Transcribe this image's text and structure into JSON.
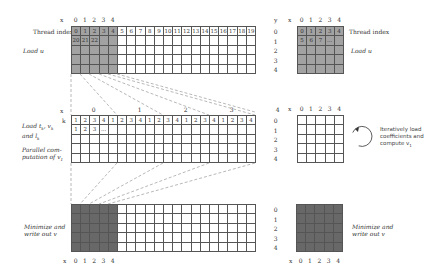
{
  "top": {
    "x_axis_label": "x",
    "x_ticks": [
      "0",
      "1",
      "2",
      "3",
      "4"
    ],
    "row_label": "Thread index",
    "thread_row": [
      "0",
      "1",
      "2",
      "3",
      "4",
      "5",
      "6",
      "7",
      "8",
      "9",
      "10",
      "11",
      "12",
      "13",
      "14",
      "15",
      "16",
      "17",
      "18",
      "19"
    ],
    "second_row": [
      "20",
      "21",
      "22",
      "",
      "",
      "",
      "",
      "",
      "",
      "",
      "",
      "",
      "",
      "",
      "",
      "",
      "",
      "",
      "",
      ""
    ],
    "step_label": "Load u"
  },
  "top_right": {
    "y_axis_label": "y",
    "x_axis_label": "x",
    "y_ticks": [
      "0",
      "1",
      "2",
      "3",
      "4"
    ],
    "x_ticks": [
      "0",
      "1",
      "2",
      "3",
      "4"
    ],
    "thread_row": [
      "0",
      "1",
      "2",
      "3",
      "4"
    ],
    "second_row": [
      "5",
      "6",
      "7",
      "...",
      ""
    ],
    "row_label": "Thread index",
    "step_label": "Load u"
  },
  "middle": {
    "x_axis_label": "x",
    "k_label": "k",
    "group_ticks": [
      "0",
      "1",
      "2",
      "3",
      "4"
    ],
    "k_row": [
      "1",
      "2",
      "3",
      "4",
      "1",
      "2",
      "3",
      "4",
      "1",
      "2",
      "3",
      "4",
      "1",
      "2",
      "3",
      "4",
      "1",
      "2",
      "3",
      "4"
    ],
    "second_row": [
      "1",
      "2",
      "3",
      "...",
      "",
      "",
      "",
      "",
      "",
      "",
      "",
      "",
      "",
      "",
      "",
      "",
      "",
      "",
      "",
      ""
    ],
    "step_label_1": "Load t",
    "step_label_1_line2": "and l",
    "step_label_2": "Parallel com-",
    "step_label_2_line2": "putation of v"
  },
  "middle_right": {
    "x_axis_label": "x",
    "y_ticks": [
      "0",
      "1",
      "2",
      "3",
      "4"
    ],
    "x_ticks": [
      "0",
      "1",
      "2",
      "3",
      "4"
    ],
    "loop_text": [
      "Iteratively load",
      "coefficients and",
      "compute v"
    ]
  },
  "bottom": {
    "x_axis_label": "x",
    "x_ticks": [
      "0",
      "1",
      "2",
      "3",
      "4"
    ],
    "step_label": [
      "Minimize and",
      "write out v"
    ]
  },
  "bottom_right": {
    "x_axis_label": "x",
    "y_ticks": [
      "0",
      "1",
      "2",
      "3",
      "4"
    ],
    "x_ticks": [
      "0",
      "1",
      "2",
      "3",
      "4"
    ],
    "step_label": [
      "Minimize and",
      "write out v"
    ]
  },
  "colors": {
    "shade_light": "#a2a2a2",
    "shade_dark": "#686868",
    "grid_line": "#555555",
    "dash": "#888888"
  }
}
